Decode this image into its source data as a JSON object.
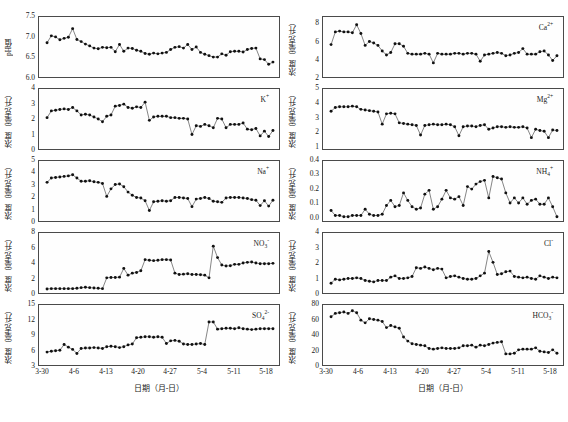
{
  "figure": {
    "xaxis_title": "日期（月-日）",
    "xtick_labels": [
      "3-30",
      "4-6",
      "4-13",
      "4-20",
      "4-27",
      "5-4",
      "5-11",
      "5-18"
    ],
    "ylabel_ph": "pH值",
    "ylabel_conc": "浓度（毫克/升）",
    "marker_color": "#111111",
    "line_color": "#222222",
    "frame_color": "#4a4a4a"
  },
  "panels": [
    {
      "id": "ph",
      "label": "",
      "label_html": "",
      "ylabel": "pH值",
      "yticks": [
        "6.0",
        "6.5",
        "7.0",
        "7.5"
      ]
    },
    {
      "id": "ca",
      "label": "Ca2+",
      "label_html": "Ca<sup>2+</sup>",
      "ylabel": "浓度（毫克/升）",
      "yticks": [
        "2",
        "4",
        "6",
        "8"
      ]
    },
    {
      "id": "k",
      "label": "K+",
      "label_html": "K<sup>+</sup>",
      "ylabel": "浓度（毫克/升）",
      "yticks": [
        "0",
        "1",
        "2",
        "3",
        "4"
      ]
    },
    {
      "id": "mg",
      "label": "Mg2+",
      "label_html": "Mg<sup>2+</sup>",
      "ylabel": "浓度（毫克/升）",
      "yticks": [
        "1",
        "2",
        "3",
        "4",
        "5"
      ]
    },
    {
      "id": "na",
      "label": "Na+",
      "label_html": "Na<sup>+</sup>",
      "ylabel": "浓度（毫克/升）",
      "yticks": [
        "0",
        "1",
        "2",
        "3",
        "4",
        "5"
      ]
    },
    {
      "id": "nh4",
      "label": "NH4+",
      "label_html": "NH<sub>4</sub><sup>+</sup>",
      "ylabel": "浓度（毫克/升）",
      "yticks": [
        "0.0",
        "0.1",
        "0.2",
        "0.3",
        "0.4"
      ]
    },
    {
      "id": "no3",
      "label": "NO3-",
      "label_html": "NO<sub>3</sub><sup>-</sup>",
      "ylabel": "浓度（毫克/升）",
      "yticks": [
        "0",
        "2",
        "4",
        "6",
        "8"
      ]
    },
    {
      "id": "cl",
      "label": "Cl-",
      "label_html": "Cl<sup>-</sup>",
      "ylabel": "浓度（毫克/升）",
      "yticks": [
        "0",
        "1",
        "2",
        "3",
        "4"
      ]
    },
    {
      "id": "so4",
      "label": "SO42-",
      "label_html": "SO<sub>4</sub><sup>2-</sup>",
      "ylabel": "浓度（毫克/升）",
      "yticks": [
        "3",
        "6",
        "9",
        "12",
        "15"
      ]
    },
    {
      "id": "hco3",
      "label": "HCO3-",
      "label_html": "HCO<sub>3</sub><sup>-</sup>",
      "ylabel": "浓度（毫克/升）",
      "yticks": [
        "0",
        "20",
        "40",
        "60",
        "80"
      ]
    }
  ],
  "chart_data": [
    {
      "type": "line",
      "id": "ph",
      "title": "",
      "xlabel": "日期（月-日）",
      "ylabel": "pH值",
      "ylim": [
        6.0,
        7.5
      ],
      "ytick_values": [
        6.0,
        6.5,
        7.0,
        7.5
      ],
      "xtick_labels": [
        "3-30",
        "4-6",
        "4-13",
        "4-20",
        "4-27",
        "5-4",
        "5-11",
        "5-18"
      ],
      "xtick_positions": [
        0,
        7,
        14,
        21,
        28,
        35,
        42,
        49
      ],
      "x": [
        0,
        1,
        2,
        3,
        4,
        5,
        6,
        7,
        8,
        9,
        10,
        11,
        12,
        13,
        14,
        15,
        16,
        17,
        18,
        19,
        20,
        21,
        22,
        23,
        24,
        25,
        26,
        27,
        28,
        29,
        30,
        31,
        32,
        33,
        34,
        35,
        36,
        37,
        38,
        39,
        40,
        41,
        42,
        43,
        44,
        45,
        46,
        47,
        48,
        49,
        50,
        51,
        52,
        53
      ],
      "values": [
        6.87,
        7.06,
        7.03,
        6.95,
        6.99,
        7.02,
        7.26,
        6.96,
        6.9,
        6.83,
        6.78,
        6.72,
        6.7,
        6.74,
        6.73,
        6.74,
        6.62,
        6.82,
        6.63,
        6.72,
        6.71,
        6.66,
        6.63,
        6.57,
        6.55,
        6.58,
        6.56,
        6.58,
        6.6,
        6.68,
        6.74,
        6.76,
        6.72,
        6.82,
        6.68,
        6.75,
        6.6,
        6.55,
        6.51,
        6.47,
        6.47,
        6.56,
        6.52,
        6.62,
        6.63,
        6.63,
        6.61,
        6.68,
        6.71,
        6.72,
        6.42,
        6.4,
        6.27,
        6.33
      ],
      "grid": false,
      "legend": "",
      "marker": "filled-circle"
    },
    {
      "type": "line",
      "id": "ca",
      "title": "Ca2+",
      "xlabel": "日期（月-日）",
      "ylabel": "浓度（毫克/升）",
      "ylim": [
        2,
        8.8
      ],
      "ytick_values": [
        2,
        4,
        6,
        8
      ],
      "xtick_labels": [
        "3-30",
        "4-6",
        "4-13",
        "4-20",
        "4-27",
        "5-4",
        "5-11",
        "5-18"
      ],
      "values": [
        5.7,
        7.3,
        7.4,
        7.3,
        7.3,
        7.2,
        8.2,
        7.1,
        5.6,
        6.1,
        5.9,
        5.6,
        4.9,
        4.4,
        4.7,
        5.8,
        5.8,
        5.5,
        4.6,
        4.5,
        4.5,
        4.5,
        4.6,
        4.5,
        3.4,
        4.6,
        4.5,
        4.5,
        4.5,
        4.6,
        4.6,
        4.5,
        4.6,
        4.6,
        4.5,
        3.6,
        4.4,
        4.5,
        4.6,
        4.7,
        4.6,
        4.3,
        4.4,
        4.6,
        4.7,
        5.2,
        4.5,
        4.5,
        4.5,
        4.8,
        4.9,
        4.4,
        3.7,
        4.3
      ],
      "grid": false,
      "legend": "Ca2+",
      "marker": "filled-circle"
    },
    {
      "type": "line",
      "id": "k",
      "title": "K+",
      "xlabel": "日期（月-日）",
      "ylabel": "浓度（毫克/升）",
      "ylim": [
        0,
        4
      ],
      "ytick_values": [
        0,
        1,
        2,
        3,
        4
      ],
      "xtick_labels": [
        "3-30",
        "4-6",
        "4-13",
        "4-20",
        "4-27",
        "5-4",
        "5-11",
        "5-18"
      ],
      "values": [
        2.1,
        2.6,
        2.65,
        2.7,
        2.75,
        2.7,
        2.85,
        2.6,
        2.3,
        2.35,
        2.3,
        2.15,
        2.0,
        1.8,
        2.2,
        2.3,
        2.95,
        3.0,
        3.1,
        2.85,
        2.8,
        2.9,
        2.85,
        3.25,
        1.9,
        2.15,
        2.2,
        2.2,
        2.2,
        2.1,
        2.1,
        2.05,
        2.05,
        2.0,
        0.85,
        1.5,
        1.45,
        1.6,
        1.5,
        1.35,
        2.05,
        2.0,
        1.35,
        1.6,
        1.6,
        1.6,
        1.7,
        1.25,
        1.2,
        1.3,
        0.75,
        1.1,
        0.7,
        1.15
      ],
      "grid": false,
      "legend": "K+",
      "marker": "filled-circle"
    },
    {
      "type": "line",
      "id": "mg",
      "title": "Mg2+",
      "xlabel": "日期（月-日）",
      "ylabel": "浓度（毫克/升）",
      "ylim": [
        0.8,
        5
      ],
      "ytick_values": [
        1,
        2,
        3,
        4,
        5
      ],
      "xtick_labels": [
        "3-30",
        "4-6",
        "4-13",
        "4-20",
        "4-27",
        "5-4",
        "5-11",
        "5-18"
      ],
      "values": [
        3.5,
        3.8,
        3.85,
        3.85,
        3.85,
        3.9,
        3.85,
        3.65,
        3.6,
        3.55,
        3.5,
        3.45,
        2.5,
        3.3,
        3.35,
        3.3,
        2.6,
        2.55,
        2.5,
        2.45,
        2.4,
        1.65,
        2.4,
        2.45,
        2.5,
        2.45,
        2.45,
        2.5,
        2.45,
        2.3,
        1.6,
        2.3,
        2.35,
        2.35,
        2.3,
        2.4,
        2.45,
        2.1,
        2.2,
        2.3,
        2.3,
        2.25,
        2.3,
        2.25,
        2.25,
        2.3,
        2.2,
        1.45,
        2.1,
        2.0,
        1.95,
        1.45,
        2.05,
        2.0
      ],
      "grid": false,
      "legend": "Mg2+",
      "marker": "filled-circle"
    },
    {
      "type": "line",
      "id": "na",
      "title": "Na+",
      "xlabel": "日期（月-日）",
      "ylabel": "浓度（毫克/升）",
      "ylim": [
        0,
        5
      ],
      "ytick_values": [
        0,
        1,
        2,
        3,
        4,
        5
      ],
      "xtick_labels": [
        "3-30",
        "4-6",
        "4-13",
        "4-20",
        "4-27",
        "5-4",
        "5-11",
        "5-18"
      ],
      "values": [
        3.3,
        3.7,
        3.75,
        3.8,
        3.85,
        3.9,
        4.0,
        3.7,
        3.4,
        3.4,
        3.45,
        3.35,
        3.3,
        3.2,
        2.0,
        2.7,
        3.1,
        3.15,
        2.9,
        2.4,
        2.1,
        1.9,
        1.85,
        1.6,
        0.7,
        1.5,
        1.55,
        1.6,
        1.55,
        1.6,
        1.9,
        1.9,
        1.85,
        1.8,
        1.05,
        1.75,
        1.8,
        1.9,
        1.8,
        1.55,
        1.5,
        1.45,
        1.85,
        1.9,
        1.9,
        1.9,
        1.85,
        1.8,
        1.7,
        1.65,
        1.15,
        1.6,
        1.1,
        1.65
      ],
      "grid": false,
      "legend": "Na+",
      "marker": "filled-circle"
    },
    {
      "type": "line",
      "id": "nh4",
      "title": "NH4+",
      "xlabel": "日期（月-日）",
      "ylabel": "浓度（毫克/升）",
      "ylim": [
        -0.03,
        0.4
      ],
      "ytick_values": [
        0.0,
        0.1,
        0.2,
        0.3,
        0.4
      ],
      "xtick_labels": [
        "3-30",
        "4-6",
        "4-13",
        "4-20",
        "4-27",
        "5-4",
        "5-11",
        "5-18"
      ],
      "values": [
        0.03,
        -0.01,
        -0.01,
        -0.02,
        -0.02,
        -0.01,
        -0.01,
        -0.01,
        0.04,
        0.0,
        -0.01,
        -0.01,
        0.0,
        0.07,
        0.11,
        0.06,
        0.07,
        0.17,
        0.11,
        0.06,
        0.04,
        0.05,
        0.16,
        0.19,
        0.04,
        0.06,
        0.12,
        0.19,
        0.13,
        0.12,
        0.14,
        0.07,
        0.22,
        0.2,
        0.24,
        0.26,
        0.27,
        0.13,
        0.3,
        0.29,
        0.28,
        0.17,
        0.09,
        0.13,
        0.09,
        0.13,
        0.08,
        0.11,
        0.12,
        0.08,
        0.08,
        0.13,
        0.06,
        -0.02
      ],
      "grid": false,
      "legend": "NH4+",
      "marker": "filled-circle"
    },
    {
      "type": "line",
      "id": "no3",
      "title": "NO3-",
      "xlabel": "日期（月-日）",
      "ylabel": "浓度（毫克/升）",
      "ylim": [
        0,
        8
      ],
      "ytick_values": [
        0,
        2,
        4,
        6,
        8
      ],
      "xtick_labels": [
        "3-30",
        "4-6",
        "4-13",
        "4-20",
        "4-27",
        "5-4",
        "5-11",
        "5-18"
      ],
      "values": [
        0.15,
        0.2,
        0.2,
        0.2,
        0.2,
        0.2,
        0.2,
        0.25,
        0.35,
        0.4,
        0.35,
        0.3,
        0.25,
        0.2,
        1.8,
        1.85,
        1.85,
        1.9,
        3.2,
        2.2,
        2.5,
        2.6,
        2.85,
        4.5,
        4.4,
        4.35,
        4.4,
        4.5,
        4.5,
        4.45,
        2.5,
        2.3,
        2.35,
        2.4,
        2.3,
        2.3,
        2.25,
        2.2,
        1.8,
        6.5,
        4.8,
        3.7,
        3.55,
        3.6,
        3.8,
        3.8,
        4.0,
        4.1,
        4.15,
        4.0,
        3.9,
        3.9,
        3.9,
        3.95
      ],
      "grid": false,
      "legend": "NO3-",
      "marker": "filled-circle"
    },
    {
      "type": "line",
      "id": "cl",
      "title": "Cl-",
      "xlabel": "日期（月-日）",
      "ylabel": "浓度（毫克/升）",
      "ylim": [
        0,
        4
      ],
      "ytick_values": [
        0,
        1,
        2,
        3,
        4
      ],
      "xtick_labels": [
        "3-30",
        "4-6",
        "4-13",
        "4-20",
        "4-27",
        "5-4",
        "5-11",
        "5-18"
      ],
      "values": [
        0.5,
        0.8,
        0.75,
        0.8,
        0.85,
        0.85,
        0.9,
        0.85,
        0.7,
        0.65,
        0.6,
        0.7,
        0.7,
        0.7,
        0.95,
        1.05,
        0.85,
        0.85,
        0.9,
        1.0,
        1.65,
        1.6,
        1.7,
        1.6,
        1.5,
        1.6,
        1.55,
        0.9,
        1.0,
        1.05,
        0.95,
        0.85,
        0.8,
        0.8,
        0.85,
        1.05,
        1.25,
        2.85,
        2.05,
        1.15,
        1.2,
        1.35,
        1.4,
        1.0,
        0.95,
        0.9,
        0.95,
        0.85,
        0.8,
        1.05,
        0.95,
        0.85,
        0.95,
        0.9
      ],
      "grid": false,
      "legend": "Cl-",
      "marker": "filled-circle"
    },
    {
      "type": "line",
      "id": "so4",
      "title": "SO42-",
      "xlabel": "日期（月-日）",
      "ylabel": "浓度（毫克/升）",
      "ylim": [
        3,
        15
      ],
      "ytick_values": [
        3,
        6,
        9,
        12,
        15
      ],
      "xtick_labels": [
        "3-30",
        "4-6",
        "4-13",
        "4-20",
        "4-27",
        "5-4",
        "5-11",
        "5-18"
      ],
      "values": [
        5.2,
        5.4,
        5.5,
        5.6,
        6.9,
        6.3,
        5.8,
        4.9,
        6.0,
        6.1,
        6.1,
        6.2,
        6.1,
        6.0,
        6.4,
        6.5,
        6.4,
        6.2,
        6.4,
        6.8,
        7.0,
        8.4,
        8.5,
        8.6,
        8.6,
        8.5,
        8.6,
        8.5,
        7.1,
        7.7,
        7.8,
        7.6,
        7.0,
        6.9,
        6.9,
        7.0,
        7.1,
        6.9,
        11.9,
        11.9,
        10.3,
        10.4,
        10.5,
        10.5,
        10.4,
        10.6,
        10.4,
        10.3,
        10.2,
        10.3,
        10.4,
        10.4,
        10.4,
        10.4
      ],
      "grid": false,
      "legend": "SO42-",
      "marker": "filled-circle"
    },
    {
      "type": "line",
      "id": "hco3",
      "title": "HCO3-",
      "xlabel": "日期（月-日）",
      "ylabel": "浓度（毫克/升）",
      "ylim": [
        0,
        80
      ],
      "ytick_values": [
        0,
        20,
        40,
        60,
        80
      ],
      "xtick_labels": [
        "3-30",
        "4-6",
        "4-13",
        "4-20",
        "4-27",
        "5-4",
        "5-11",
        "5-18"
      ],
      "values": [
        67,
        72,
        73,
        74,
        72,
        76,
        73,
        62,
        58,
        64,
        63,
        62,
        60,
        51,
        54,
        52,
        50,
        37,
        31,
        27,
        26,
        25,
        24,
        20,
        19,
        20,
        21,
        20,
        20,
        20,
        21,
        24,
        24,
        25,
        22,
        25,
        24,
        26,
        28,
        29,
        30,
        12,
        12,
        13,
        18,
        19,
        19,
        19,
        21,
        16,
        15,
        14,
        18,
        13
      ],
      "grid": false,
      "legend": "HCO3-",
      "marker": "filled-circle"
    }
  ]
}
